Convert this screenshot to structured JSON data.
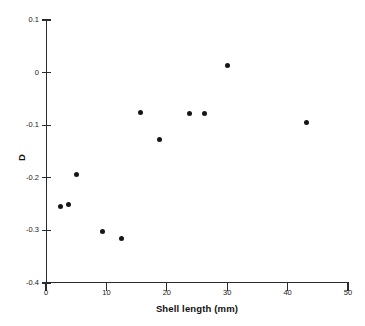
{
  "chart_data": {
    "type": "scatter",
    "title": "",
    "xlabel": "Shell length (mm)",
    "ylabel": "D",
    "xlim": [
      0,
      50
    ],
    "ylim": [
      -0.4,
      0.1
    ],
    "grid": false,
    "legend": null,
    "xticks": [
      0,
      10,
      20,
      30,
      40,
      50
    ],
    "xtick_labels": [
      "0",
      "10",
      "20",
      "30",
      "40",
      "50"
    ],
    "yticks": [
      0.1,
      0,
      -0.1,
      -0.2,
      -0.3,
      -0.4
    ],
    "ytick_labels": [
      "0.1",
      "0",
      "-0.1",
      "-0.2",
      "-0.3",
      "-0.4"
    ],
    "marker": "filled-circle",
    "marker_color": "#161616",
    "points": [
      {
        "x": 2.4,
        "y": -0.255
      },
      {
        "x": 3.7,
        "y": -0.251
      },
      {
        "x": 5.0,
        "y": -0.193
      },
      {
        "x": 9.3,
        "y": -0.302
      },
      {
        "x": 12.5,
        "y": -0.316
      },
      {
        "x": 15.7,
        "y": -0.075
      },
      {
        "x": 18.8,
        "y": -0.128
      },
      {
        "x": 23.8,
        "y": -0.078
      },
      {
        "x": 26.2,
        "y": -0.078
      },
      {
        "x": 30.0,
        "y": 0.013
      },
      {
        "x": 43.2,
        "y": -0.095
      }
    ]
  },
  "axes": {
    "x_title": "Shell length (mm)",
    "y_title": "D"
  }
}
